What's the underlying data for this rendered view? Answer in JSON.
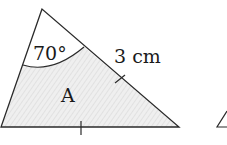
{
  "diagram": {
    "shape": "triangle",
    "region_label": "A",
    "angle_label": "70°",
    "side_label": "3 cm",
    "marks": {
      "equal_side_ticks": 2,
      "description": "tick marks on right side and base indicating equal lengths"
    },
    "fill": "light hatched gray",
    "colors": {
      "stroke": "#2a2a2a",
      "fill": "#ececec",
      "hatch": "#d4d4d4"
    }
  }
}
